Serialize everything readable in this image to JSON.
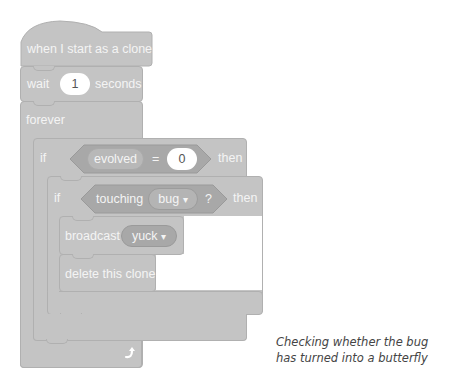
{
  "script": {
    "hat": {
      "label": "when I start as a clone"
    },
    "wait": {
      "prefix": "wait",
      "value": "1",
      "suffix": "seconds"
    },
    "forever": {
      "label": "forever",
      "end_icon": "loop-arrow-icon"
    },
    "outer_if": {
      "label": "if",
      "then_label": "then",
      "condition": {
        "variable": "evolved",
        "operator": "=",
        "value": "0"
      }
    },
    "inner_if": {
      "label": "if",
      "then_label": "then",
      "condition": {
        "prefix": "touching",
        "target": "bug",
        "dropdown_icon": "▾",
        "suffix": "?"
      }
    },
    "broadcast": {
      "label": "broadcast",
      "message": "yuck",
      "dropdown_icon": "▾"
    },
    "delete_clone": {
      "label": "delete this clone"
    }
  },
  "caption": {
    "line1": "Checking whether the bug",
    "line2": "has turned into a butterfly"
  },
  "colors": {
    "block": "#c4c4c4",
    "block_border": "#b0b0b0",
    "reporter": "#a8a8a8",
    "text": "#f4f4f4"
  }
}
